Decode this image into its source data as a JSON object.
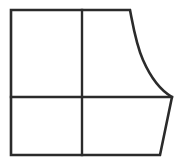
{
  "figure": {
    "kind": "line-drawing",
    "canvas": {
      "width": 183,
      "height": 167
    },
    "style": {
      "background_color": "#ffffff",
      "stroke_color": "#2b2b2b",
      "outline_width": 2.6,
      "divider_width": 2.4,
      "fill_color": "#ffffff"
    },
    "geometry": {
      "outline_path": "M 11 10 L 130 10 C 133.5 28 136 44 143 60 C 150 76 160 90 172 97 L 160 155 L 11 155 Z",
      "points": {
        "top_left": {
          "x": 11,
          "y": 10
        },
        "top_right": {
          "x": 130,
          "y": 10
        },
        "curve_control_1": {
          "x": 133.5,
          "y": 28
        },
        "curve_control_2": {
          "x": 136,
          "y": 44
        },
        "curve_mid": {
          "x": 143,
          "y": 60
        },
        "curve_control_3": {
          "x": 150,
          "y": 76
        },
        "curve_control_4": {
          "x": 160,
          "y": 90
        },
        "right_junction": {
          "x": 172,
          "y": 97
        },
        "bottom_right": {
          "x": 160,
          "y": 155
        },
        "bottom_left": {
          "x": 11,
          "y": 155
        }
      },
      "vertical_divider": {
        "x": 82,
        "y1": 10,
        "y2": 155
      },
      "horizontal_divider": {
        "y": 97,
        "x1": 11,
        "x2": 172
      },
      "curve_side": "right",
      "curve_type": "concave-ogee"
    },
    "cells": [
      {
        "name": "upper-left",
        "shape": "rectangle",
        "bounds": {
          "x": 11,
          "y": 10,
          "width": 71,
          "height": 87
        }
      },
      {
        "name": "upper-right",
        "shape": "curved-panel",
        "bounds": {
          "x": 82,
          "y": 10,
          "width": 90,
          "height": 87
        }
      },
      {
        "name": "lower-left",
        "shape": "rectangle",
        "bounds": {
          "x": 11,
          "y": 97,
          "width": 71,
          "height": 58
        }
      },
      {
        "name": "lower-right",
        "shape": "trapezoid",
        "bounds": {
          "x": 82,
          "y": 97,
          "width": 90,
          "height": 58
        }
      }
    ]
  }
}
